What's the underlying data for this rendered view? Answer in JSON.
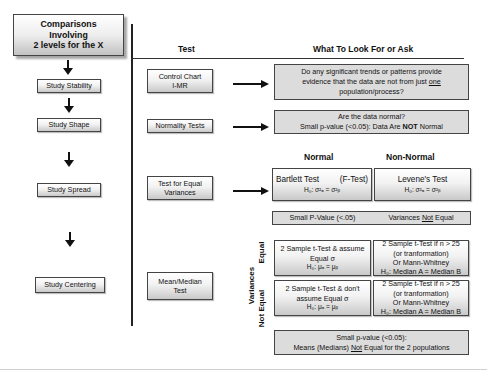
{
  "title": {
    "line1": "Comparisons",
    "line2": "Involving",
    "line3": "2 levels for the X"
  },
  "steps": [
    {
      "label": "Study Stability"
    },
    {
      "label": "Study Shape"
    },
    {
      "label": "Study Spread"
    },
    {
      "label": "Study Centering"
    }
  ],
  "columns": {
    "test": "Test",
    "what": "What To Look For or Ask"
  },
  "tests": {
    "control_chart": {
      "line1": "Control Chart",
      "line2": "I-MR"
    },
    "normality": {
      "label": "Normality Tests"
    },
    "equal_var": {
      "line1": "Test for Equal",
      "line2": "Variances"
    },
    "mean_median": {
      "line1": "Mean/Median",
      "line2": "Test"
    }
  },
  "stability": {
    "line1": "Do any significant trends or patterns provide",
    "line2a": "evidence that the data are not from just ",
    "line2b": "one",
    "line3": "population/process?"
  },
  "normality": {
    "line1": "Are the data normal?",
    "line2a": "Small p-value (<0.05): Data Are ",
    "line2b": "NOT",
    "line2c": " Normal"
  },
  "spread": {
    "normal_header": "Normal",
    "nonnormal_header": "Non-Normal",
    "bartlett": {
      "name": "Bartlett Test",
      "alt": "(F-Test)",
      "hyp": "H₀: σ²ₐ = σ²ᵦ"
    },
    "levene": {
      "name": "Levene's Test",
      "hyp": "H₀: σ²ₐ = σ²ᵦ"
    },
    "result_left": "Small P-Value (<.05)",
    "result_right_a": "Variances ",
    "result_right_b": "Not",
    "result_right_c": " Equal"
  },
  "centering": {
    "row_label_main": "Variances",
    "row_equal": "Equal",
    "row_not_equal": "Not Equal",
    "equal_normal": {
      "line1": "2 Sample t-Test & assume",
      "line2": "Equal σ",
      "line3": "H₀: μₐ = μᵦ"
    },
    "equal_nonnormal": {
      "line1": "2 Sample t-Test if n > 25",
      "line2": "(or tranformation)",
      "line3": "Or Mann-Whitney",
      "line4": "H₀: Median A = Median B"
    },
    "notequal_normal": {
      "line1": "2 Sample t-Test & don't",
      "line2": "assume Equal σ",
      "line3": "H₀: μₐ = μᵦ"
    },
    "notequal_nonnormal": {
      "line1": "2 Sample t-Test if n > 25",
      "line2": "(or tranformation)",
      "line3": "Or Mann-Whitney",
      "line4": "H₀: Median A = Median B"
    },
    "result_line1": "Small p-value (<0.05):",
    "result_line2a": "Means (Medians) ",
    "result_line2b": "Not",
    "result_line2c": " Equal for the 2 populations"
  }
}
